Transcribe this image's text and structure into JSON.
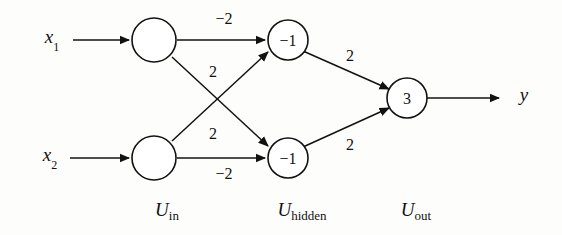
{
  "diagram": {
    "background_color": "#fdfdfb",
    "stroke_color": "#121212",
    "inputs": [
      {
        "name": "input-x1",
        "base": "x",
        "sub": "1"
      },
      {
        "name": "input-x2",
        "base": "x",
        "sub": "2"
      }
    ],
    "output": {
      "name": "output-y",
      "base": "y"
    },
    "layers": [
      {
        "name": "layer-label-in",
        "u": "U",
        "sub": "in"
      },
      {
        "name": "layer-label-hidden",
        "u": "U",
        "sub": "hidden"
      },
      {
        "name": "layer-label-out",
        "u": "U",
        "sub": "out"
      }
    ],
    "nodes": [
      {
        "name": "node-in-1",
        "value": ""
      },
      {
        "name": "node-in-2",
        "value": ""
      },
      {
        "name": "node-hidden-1",
        "value": "−1"
      },
      {
        "name": "node-hidden-2",
        "value": "−1"
      },
      {
        "name": "node-out",
        "value": "3"
      }
    ],
    "weights": [
      {
        "name": "weight-in1-hidden1",
        "value": "−2"
      },
      {
        "name": "weight-in1-hidden2",
        "value": "2"
      },
      {
        "name": "weight-in2-hidden1",
        "value": "2"
      },
      {
        "name": "weight-in2-hidden2",
        "value": "−2"
      },
      {
        "name": "weight-hidden1-out",
        "value": "2"
      },
      {
        "name": "weight-hidden2-out",
        "value": "2"
      }
    ]
  }
}
